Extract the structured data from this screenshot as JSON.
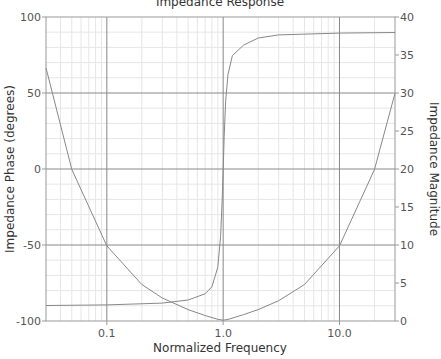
{
  "chart_data": {
    "type": "line",
    "title": "Impedance Response",
    "xlabel": "Normalized Frequency",
    "ylabel": "Impedance Phase (degrees)",
    "y2label": "Impedance Magnitude",
    "xscale": "log",
    "xlim": [
      0.03,
      30
    ],
    "ylim": [
      -100,
      100
    ],
    "y2lim": [
      0,
      40
    ],
    "x_ticks": [
      0.1,
      1.0,
      10.0
    ],
    "x_tick_labels": [
      "0.1",
      "1.0",
      "10.0"
    ],
    "y_ticks": [
      -100,
      -50,
      0,
      50,
      100
    ],
    "y_tick_labels": [
      "-100",
      "-50",
      "0",
      "50",
      "100"
    ],
    "y2_ticks": [
      0,
      5,
      10,
      15,
      20,
      25,
      30,
      35,
      40
    ],
    "y2_tick_labels": [
      "0",
      "5",
      "10",
      "15",
      "20",
      "25",
      "30",
      "35",
      "40"
    ],
    "grid": true,
    "legend": null,
    "series": [
      {
        "name": "Impedance Phase",
        "axis": "left",
        "color": "#888888",
        "x": [
          0.03,
          0.1,
          0.3,
          0.5,
          0.7,
          0.8,
          0.9,
          0.95,
          0.98,
          1.0,
          1.02,
          1.05,
          1.1,
          1.2,
          1.5,
          2.0,
          3.0,
          10.0,
          30.0
        ],
        "values": [
          -89.8,
          -89.4,
          -88.2,
          -86.2,
          -82.1,
          -77.5,
          -64.6,
          -44.3,
          -21.5,
          0,
          21.5,
          44.3,
          62.4,
          74.6,
          81.5,
          86.2,
          88.2,
          89.4,
          89.8
        ]
      },
      {
        "name": "Impedance Magnitude",
        "axis": "right",
        "color": "#888888",
        "x": [
          0.03,
          0.05,
          0.1,
          0.2,
          0.3,
          0.5,
          0.7,
          0.9,
          1.0,
          1.1,
          1.5,
          2.0,
          3.0,
          5.0,
          10.0,
          20.0,
          30.0
        ],
        "values": [
          33.3,
          19.95,
          9.9,
          4.8,
          3.03,
          1.5,
          0.73,
          0.23,
          0.1,
          0.21,
          0.84,
          1.5,
          2.67,
          4.8,
          9.9,
          19.95,
          29.97
        ]
      }
    ]
  },
  "colors": {
    "frame": "#999999",
    "major_grid": "#888888",
    "minor_grid": "#e6e6e6",
    "line": "#888888",
    "text": "#555555"
  }
}
